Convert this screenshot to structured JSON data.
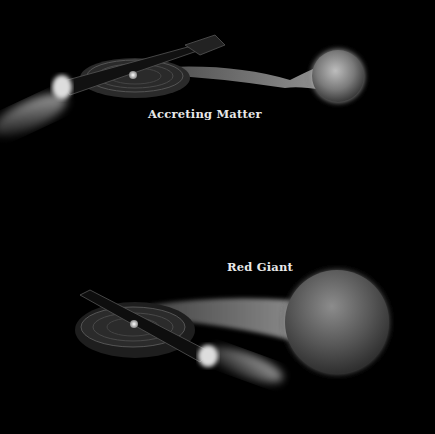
{
  "diagram": {
    "panels": [
      {
        "id": "top",
        "label": "Accreting Matter",
        "components": [
          "accretion-disk",
          "compact-star",
          "polar-jets",
          "mass-stream",
          "companion-star-small"
        ]
      },
      {
        "id": "bottom",
        "label": "Red Giant",
        "components": [
          "accretion-disk",
          "compact-star",
          "polar-jets",
          "mass-stream",
          "companion-red-giant"
        ]
      }
    ],
    "colors": {
      "background": "#000000",
      "label": "#e8e8e8",
      "disk": "#4a4a4a",
      "star": "#8a8a8a"
    }
  }
}
